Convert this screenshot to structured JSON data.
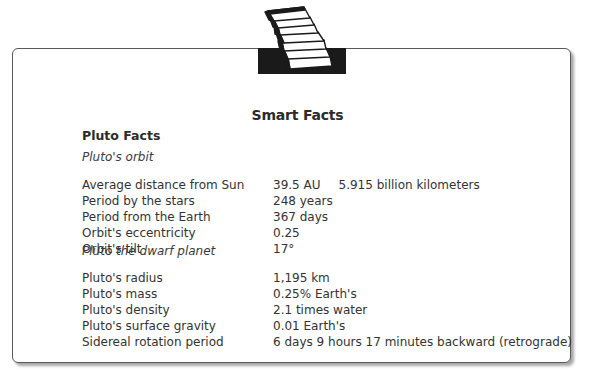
{
  "header": {
    "icon": "stacked-books-icon",
    "title": "Smart Facts"
  },
  "card": {
    "heading": "Pluto Facts",
    "sections": [
      {
        "title": "Pluto's orbit",
        "rows": [
          {
            "label": "Average distance from Sun",
            "value": "39.5 AU",
            "extra": "5.915 billion kilometers"
          },
          {
            "label": "Period by the stars",
            "value": "248 years"
          },
          {
            "label": "Period from the Earth",
            "value": "367 days"
          },
          {
            "label": "Orbit's eccentricity",
            "value": "0.25"
          },
          {
            "label": "Orbit's tilt",
            "value": "17°"
          }
        ]
      },
      {
        "title": "Pluto the dwarf planet",
        "rows": [
          {
            "label": "Pluto's radius",
            "value": "1,195 km"
          },
          {
            "label": "Pluto's mass",
            "value": "0.25% Earth's"
          },
          {
            "label": "Pluto's density",
            "value": "2.1 times water"
          },
          {
            "label": "Pluto's surface gravity",
            "value": "0.01 Earth's"
          },
          {
            "label": "Sidereal rotation period",
            "value": "6 days 9 hours 17 minutes backward (retrograde)"
          }
        ]
      }
    ]
  },
  "colors": {
    "border": "#5a5a5a",
    "text": "#2b2b2b",
    "icon_fill": "#1a1a1a"
  }
}
